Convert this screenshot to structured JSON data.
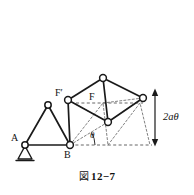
{
  "figure": {
    "caption_mark": "図",
    "caption_number": "12−7",
    "caption_full": "図 12−7",
    "background_color": "#ffffff",
    "line_color": "#1a1a1a",
    "dash_color": "#555555"
  },
  "labels": {
    "point_a": "A",
    "point_b": "B",
    "force_f": "F",
    "force_f_prime": "F′",
    "angle_theta": "θ",
    "dimension_2a_theta": "2aθ"
  },
  "icons": {
    "pin_support": "pin-support-icon",
    "dimension_arrow": "double-headed-arrow-icon",
    "joint": "pin-joint-circle-icon"
  },
  "geometry": {
    "nodes": [
      {
        "id": "A",
        "x": 25,
        "y": 145,
        "label": "A"
      },
      {
        "id": "apexL",
        "x": 48,
        "y": 105,
        "label": ""
      },
      {
        "id": "B",
        "x": 70,
        "y": 145,
        "label": "B"
      },
      {
        "id": "Fp",
        "x": 68,
        "y": 100,
        "label": "F′"
      },
      {
        "id": "top",
        "x": 103,
        "y": 78,
        "label": ""
      },
      {
        "id": "mid",
        "x": 108,
        "y": 122,
        "label": ""
      },
      {
        "id": "right",
        "x": 143,
        "y": 98,
        "label": ""
      }
    ],
    "baseline_y": 145,
    "baseline_x_start": 70,
    "baseline_x_end": 150,
    "dimension": {
      "x": 155,
      "y_top": 90,
      "y_bottom": 145,
      "label": "2aθ"
    }
  }
}
